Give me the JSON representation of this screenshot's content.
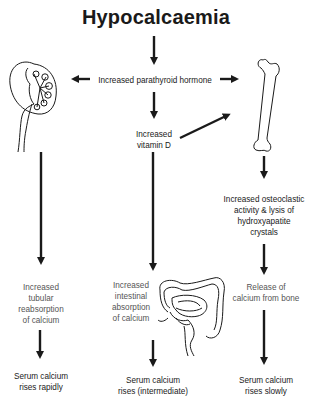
{
  "title": "Hypocalcaemia",
  "nodes": {
    "pth": "Increased parathyroid hormone",
    "vitd_line1": "Increased",
    "vitd_line2": "vitamin D",
    "osteo_line1": "Increased osteoclastic",
    "osteo_line2": "activity & lysis of",
    "osteo_line3": "hydroxyapatite",
    "osteo_line4": "crystals",
    "kidney_effect_line1": "Increased",
    "kidney_effect_line2": "tubular",
    "kidney_effect_line3": "reabsorption",
    "kidney_effect_line4": "of calcium",
    "gut_effect_line1": "Increased",
    "gut_effect_line2": "intestinal",
    "gut_effect_line3": "absorption",
    "gut_effect_line4": "of calcium",
    "bone_effect_line1": "Release of",
    "bone_effect_line2": "calcium from bone",
    "outcome_kidney_line1": "Serum calcium",
    "outcome_kidney_line2": "rises rapidly",
    "outcome_gut_line1": "Serum calcium",
    "outcome_gut_line2": "rises (intermediate)",
    "outcome_bone_line1": "Serum calcium",
    "outcome_bone_line2": "rises slowly"
  },
  "icons": {
    "kidney": "kidney-icon",
    "bone": "femur-bone-icon",
    "intestine": "intestine-icon"
  },
  "colors": {
    "ink": "#1a1a1a",
    "secondary_text": "#555555",
    "background": "#ffffff"
  }
}
